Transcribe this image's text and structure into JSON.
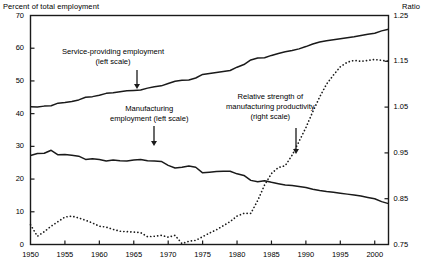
{
  "chart_data": {
    "type": "line",
    "title": "",
    "xlabel": "",
    "ylabel_left": "Percent of total employment",
    "ylabel_right": "Ratio",
    "grid": false,
    "legend_position": "inline-annotations",
    "xlim": [
      1950,
      2002
    ],
    "xticks": [
      "1950",
      "1955",
      "1960",
      "1965",
      "1970",
      "1975",
      "1980",
      "1985",
      "1990",
      "1995",
      "2000"
    ],
    "ylim_left": [
      0,
      70
    ],
    "yticks_left": [
      "0",
      "10",
      "20",
      "30",
      "40",
      "50",
      "60",
      "70"
    ],
    "ylim_right": [
      0.75,
      1.25
    ],
    "yticks_right": [
      "0.75",
      "0.85",
      "0.95",
      "1.05",
      "1.15",
      "1.25"
    ],
    "annotations": [
      {
        "id": "service",
        "line1": "Service-providing employment",
        "line2": "(left scale)",
        "arrow": "down"
      },
      {
        "id": "manufacturing",
        "line1": "Manufacturing",
        "line2": "employment (left scale)",
        "arrow": "down"
      },
      {
        "id": "ratio",
        "line1": "Relative strength of",
        "line2": "manufacturing productivity",
        "line3": "(right scale)",
        "arrow": "down"
      }
    ],
    "series": [
      {
        "name": "Service-providing employment (left scale)",
        "axis": "left",
        "style": "solid",
        "color": "#1a1a1a",
        "x": [
          1950,
          1951,
          1952,
          1953,
          1954,
          1955,
          1956,
          1957,
          1958,
          1959,
          1960,
          1961,
          1962,
          1963,
          1964,
          1965,
          1966,
          1967,
          1968,
          1969,
          1970,
          1971,
          1972,
          1973,
          1974,
          1975,
          1976,
          1977,
          1978,
          1979,
          1980,
          1981,
          1982,
          1983,
          1984,
          1985,
          1986,
          1987,
          1988,
          1989,
          1990,
          1991,
          1992,
          1993,
          1994,
          1995,
          1996,
          1997,
          1998,
          1999,
          2000,
          2001,
          2002
        ],
        "values": [
          42.1,
          42.0,
          42.3,
          42.4,
          43.2,
          43.4,
          43.7,
          44.2,
          45.0,
          45.2,
          45.6,
          46.2,
          46.4,
          46.7,
          47.0,
          47.1,
          47.2,
          47.8,
          48.2,
          48.5,
          49.2,
          49.9,
          50.2,
          50.3,
          50.9,
          52.0,
          52.3,
          52.6,
          52.9,
          53.2,
          54.2,
          55.0,
          56.4,
          57.0,
          57.1,
          57.8,
          58.4,
          58.9,
          59.3,
          59.8,
          60.5,
          61.3,
          61.9,
          62.3,
          62.6,
          62.9,
          63.2,
          63.5,
          63.9,
          64.3,
          64.6,
          65.3,
          65.8
        ]
      },
      {
        "name": "Manufacturing employment (left scale)",
        "axis": "left",
        "style": "solid",
        "color": "#1a1a1a",
        "x": [
          1950,
          1951,
          1952,
          1953,
          1954,
          1955,
          1956,
          1957,
          1958,
          1959,
          1960,
          1961,
          1962,
          1963,
          1964,
          1965,
          1966,
          1967,
          1968,
          1969,
          1970,
          1971,
          1972,
          1973,
          1974,
          1975,
          1976,
          1977,
          1978,
          1979,
          1980,
          1981,
          1982,
          1983,
          1984,
          1985,
          1986,
          1987,
          1988,
          1989,
          1990,
          1991,
          1992,
          1993,
          1994,
          1995,
          1996,
          1997,
          1998,
          1999,
          2000,
          2001,
          2002
        ],
        "values": [
          27.2,
          27.8,
          27.9,
          28.8,
          27.4,
          27.5,
          27.3,
          27.0,
          26.0,
          26.2,
          26.0,
          25.5,
          25.8,
          25.6,
          25.5,
          25.8,
          26.0,
          25.6,
          25.5,
          25.4,
          24.2,
          23.4,
          23.6,
          24.0,
          23.6,
          21.9,
          22.1,
          22.3,
          22.4,
          22.4,
          21.6,
          21.1,
          19.6,
          19.2,
          19.5,
          19.0,
          18.6,
          18.2,
          18.0,
          17.7,
          17.4,
          16.9,
          16.5,
          16.2,
          16.0,
          15.7,
          15.4,
          15.1,
          14.8,
          14.4,
          14.0,
          13.1,
          12.5
        ]
      },
      {
        "name": "Relative strength of manufacturing productivity (right scale)",
        "axis": "right",
        "style": "dotted",
        "color": "#1a1a1a",
        "x": [
          1950,
          1951,
          1952,
          1953,
          1954,
          1955,
          1956,
          1957,
          1958,
          1959,
          1960,
          1961,
          1962,
          1963,
          1964,
          1965,
          1966,
          1967,
          1968,
          1969,
          1970,
          1971,
          1972,
          1973,
          1974,
          1975,
          1976,
          1977,
          1978,
          1979,
          1980,
          1981,
          1982,
          1983,
          1984,
          1985,
          1986,
          1987,
          1988,
          1989,
          1990,
          1991,
          1992,
          1993,
          1994,
          1995,
          1996,
          1997,
          1998,
          1999,
          2000,
          2001,
          2002
        ],
        "values": [
          0.793,
          0.768,
          0.778,
          0.79,
          0.8,
          0.81,
          0.812,
          0.808,
          0.803,
          0.797,
          0.79,
          0.788,
          0.783,
          0.779,
          0.778,
          0.777,
          0.776,
          0.767,
          0.768,
          0.77,
          0.766,
          0.77,
          0.752,
          0.757,
          0.759,
          0.767,
          0.775,
          0.782,
          0.791,
          0.8,
          0.812,
          0.818,
          0.818,
          0.846,
          0.88,
          0.905,
          0.918,
          0.922,
          0.945,
          0.975,
          1.005,
          1.04,
          1.072,
          1.1,
          1.12,
          1.138,
          1.148,
          1.152,
          1.15,
          1.152,
          1.154,
          1.152,
          1.15
        ]
      }
    ]
  }
}
